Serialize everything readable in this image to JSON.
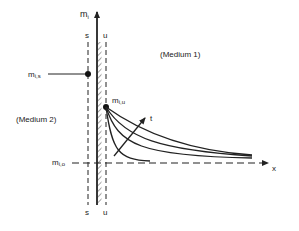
{
  "diagram": {
    "axis_y_label": "m",
    "axis_y_sub": "i",
    "axis_x_label": "x",
    "plane_s_label": "s",
    "plane_u_label": "u",
    "point_s_label": "m",
    "point_s_sub": "i,s",
    "point_u_label": "m",
    "point_u_sub": "i,u",
    "point_o_label": "m",
    "point_o_sub": "i,o",
    "medium1_label": "(Medium 1)",
    "medium2_label": "(Medium 2)",
    "time_arrow_label": "t",
    "colors": {
      "ink": "#222222",
      "background": "#ffffff"
    },
    "curves_count": 4
  }
}
